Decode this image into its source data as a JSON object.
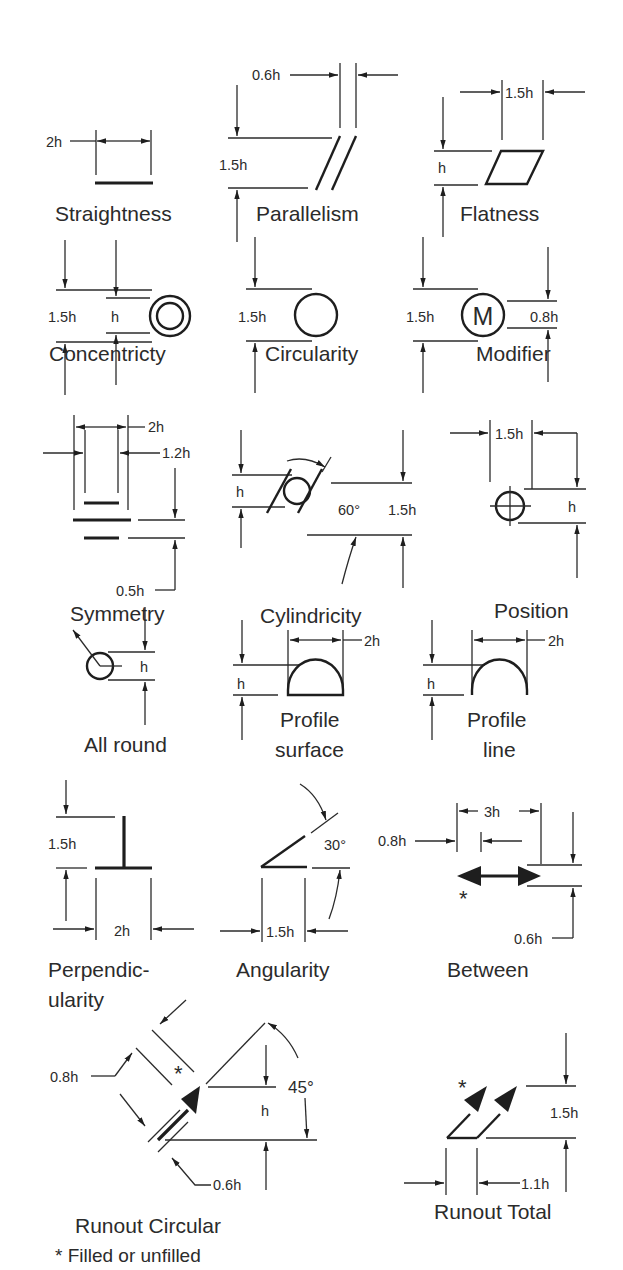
{
  "diagram": {
    "unit_note": "h = lettering height",
    "footnote": "* Filled or unfilled",
    "line_color": "#1e1e1e",
    "background": "#ffffff",
    "symbols": [
      {
        "id": "straightness",
        "label": "Straightness",
        "dims": {
          "width": "2h"
        }
      },
      {
        "id": "parallelism",
        "label": "Parallelism",
        "dims": {
          "gap": "0.6h",
          "height": "1.5h"
        }
      },
      {
        "id": "flatness",
        "label": "Flatness",
        "dims": {
          "width": "1.5h",
          "height": "h"
        }
      },
      {
        "id": "concentricity",
        "label": "Concentricty",
        "dims": {
          "outer": "1.5h",
          "inner": "h"
        }
      },
      {
        "id": "circularity",
        "label": "Circularity",
        "dims": {
          "diameter": "1.5h"
        }
      },
      {
        "id": "modifier",
        "label": "Modifier",
        "letter": "M",
        "dims": {
          "circle": "1.5h",
          "letter": "0.8h"
        }
      },
      {
        "id": "symmetry",
        "label": "Symmetry",
        "dims": {
          "outer": "2h",
          "inner": "1.2h",
          "spacing": "0.5h"
        }
      },
      {
        "id": "cylindricity",
        "label": "Cylindricity",
        "dims": {
          "circle": "h",
          "angle": "60°",
          "height": "1.5h"
        }
      },
      {
        "id": "position",
        "label": "Position",
        "dims": {
          "width": "1.5h",
          "circle": "h"
        }
      },
      {
        "id": "all-round",
        "label": "All round",
        "dims": {
          "circle": "h"
        }
      },
      {
        "id": "profile-surface",
        "label_line1": "Profile",
        "label_line2": "surface",
        "dims": {
          "width": "2h",
          "height": "h"
        }
      },
      {
        "id": "profile-line",
        "label_line1": "Profile",
        "label_line2": "line",
        "dims": {
          "width": "2h",
          "height": "h"
        }
      },
      {
        "id": "perpendicularity",
        "label_line1": "Perpendic-",
        "label_line2": "ularity",
        "dims": {
          "height": "1.5h",
          "width": "2h"
        }
      },
      {
        "id": "angularity",
        "label": "Angularity",
        "dims": {
          "angle": "30°",
          "width": "1.5h"
        }
      },
      {
        "id": "between",
        "label": "Between",
        "asterisk": "*",
        "dims": {
          "length": "3h",
          "head": "0.8h",
          "height": "0.6h"
        }
      },
      {
        "id": "runout-circular",
        "label": "Runout Circular",
        "asterisk": "*",
        "dims": {
          "spacing": "0.8h",
          "gap": "0.6h",
          "angle": "45°",
          "height": "h"
        }
      },
      {
        "id": "runout-total",
        "label": "Runout Total",
        "asterisk": "*",
        "dims": {
          "height": "1.5h",
          "spacing": "1.1h"
        }
      }
    ]
  }
}
